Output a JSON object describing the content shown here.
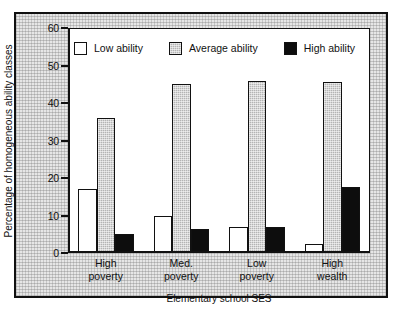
{
  "chart_data": {
    "type": "bar",
    "title": "",
    "xlabel": "Elementary school SES",
    "ylabel": "Percentage of homogeneous ability classes",
    "ylim": [
      0,
      60
    ],
    "yticks": [
      0,
      10,
      20,
      30,
      40,
      50,
      60
    ],
    "grid": false,
    "legend_position": "top-inside",
    "categories": [
      "High poverty",
      "Med. poverty",
      "Low poverty",
      "High wealth"
    ],
    "category_lines": [
      [
        "High",
        "poverty"
      ],
      [
        "Med.",
        "poverty"
      ],
      [
        "Low",
        "poverty"
      ],
      [
        "High",
        "wealth"
      ]
    ],
    "series": [
      {
        "name": "Low ability",
        "fill": "white",
        "values": [
          17,
          10,
          7,
          2.5
        ]
      },
      {
        "name": "Average ability",
        "fill": "gray-hatched",
        "values": [
          36,
          45,
          46,
          45.5
        ]
      },
      {
        "name": "High ability",
        "fill": "black",
        "values": [
          5,
          6.5,
          7,
          17.5
        ]
      }
    ]
  },
  "legend": {
    "items": [
      {
        "label": "Low ability",
        "swatch": "white"
      },
      {
        "label": "Average ability",
        "swatch": "gray"
      },
      {
        "label": "High ability",
        "swatch": "black"
      }
    ]
  },
  "axis": {
    "y_title": "Percentage of homogeneous ability classes",
    "x_title": "Elementary school SES",
    "y_tick_labels": [
      "0",
      "10",
      "20",
      "30",
      "40",
      "50",
      "60"
    ]
  },
  "colors": {
    "low_ability": "#ffffff",
    "average_ability": "#b4b4b4",
    "high_ability": "#0d0d0d",
    "outline": "#111111",
    "mat": "#e6e6e6",
    "plot_bg": "#ffffff"
  }
}
